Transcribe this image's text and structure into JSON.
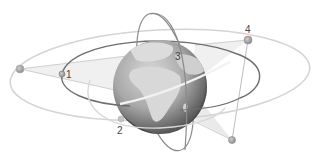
{
  "diagram": {
    "colors": {
      "background": "#ffffff",
      "globe_ocean": "#9a9a9a",
      "globe_land": "#d6d6d6",
      "globe_shadow": "#4a4a4a",
      "orbit_light": "#cfcfcf",
      "orbit_dark": "#6e6e6e",
      "beam_fill": "#e6e6e6",
      "node_fill": "#9a9a9a",
      "label_color": "#444444"
    },
    "satellites": [
      {
        "id": "1",
        "label": "1"
      },
      {
        "id": "2",
        "label": "2"
      },
      {
        "id": "3",
        "label": "3"
      },
      {
        "id": "4",
        "label": "4"
      }
    ],
    "unlabeled_nodes": [
      {
        "id": "left-node"
      },
      {
        "id": "bottom-right-node"
      }
    ]
  }
}
